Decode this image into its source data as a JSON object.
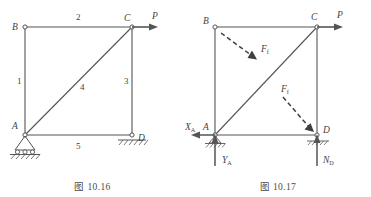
{
  "figures": [
    {
      "id": "fig-10-16",
      "caption": "图 10.16",
      "nodes": [
        {
          "name": "B",
          "label": "B",
          "x": 25,
          "y": 27
        },
        {
          "name": "C",
          "label": "C",
          "x": 132,
          "y": 27
        },
        {
          "name": "A",
          "label": "A",
          "x": 25,
          "y": 135
        },
        {
          "name": "D",
          "label": "D",
          "x": 132,
          "y": 135
        }
      ],
      "members": [
        {
          "name": "member-1-AB",
          "label": "1",
          "from": "A",
          "to": "B"
        },
        {
          "name": "member-2-BC",
          "label": "2",
          "from": "B",
          "to": "C"
        },
        {
          "name": "member-3-CD",
          "label": "3",
          "from": "C",
          "to": "D"
        },
        {
          "name": "member-4-AC",
          "label": "4",
          "from": "A",
          "to": "C"
        },
        {
          "name": "member-5-AD",
          "label": "5",
          "from": "A",
          "to": "D"
        }
      ],
      "loads": [
        {
          "name": "load-P",
          "label": "P",
          "at": "C",
          "direction": "right"
        }
      ],
      "supports": [
        {
          "name": "pin-support-A",
          "type": "pin-roller",
          "at": "A"
        },
        {
          "name": "ground-support-D",
          "type": "hatched-ground",
          "at": "D"
        }
      ]
    },
    {
      "id": "fig-10-17",
      "caption": "图 10.17",
      "nodes": [
        {
          "name": "B",
          "label": "B",
          "x": 30,
          "y": 27
        },
        {
          "name": "C",
          "label": "C",
          "x": 132,
          "y": 27
        },
        {
          "name": "A",
          "label": "A",
          "x": 30,
          "y": 135
        },
        {
          "name": "D",
          "label": "D",
          "x": 132,
          "y": 135
        }
      ],
      "loads": [
        {
          "name": "load-P",
          "label": "P",
          "sub": "",
          "at": "C",
          "direction": "right",
          "style": "solid"
        },
        {
          "name": "friction-force-upper",
          "label": "F",
          "sub": "f",
          "style": "dashed",
          "direction": "down-right"
        },
        {
          "name": "friction-force-lower",
          "label": "F",
          "sub": "f",
          "style": "dashed",
          "direction": "down-right"
        }
      ],
      "reactions": [
        {
          "name": "reaction-XA",
          "label": "X",
          "sub": "A",
          "at": "A",
          "direction": "left"
        },
        {
          "name": "reaction-YA",
          "label": "Y",
          "sub": "A",
          "at": "A",
          "direction": "up"
        },
        {
          "name": "reaction-ND",
          "label": "N",
          "sub": "D",
          "at": "D",
          "direction": "up"
        }
      ],
      "supports": [
        {
          "name": "pin-support-A",
          "type": "pin-roller",
          "at": "A"
        },
        {
          "name": "ground-support-D",
          "type": "hatched-ground",
          "at": "D"
        }
      ]
    }
  ],
  "colors": {
    "line": "#555555",
    "text": "#3f3f3f",
    "background": "#ffffff"
  }
}
